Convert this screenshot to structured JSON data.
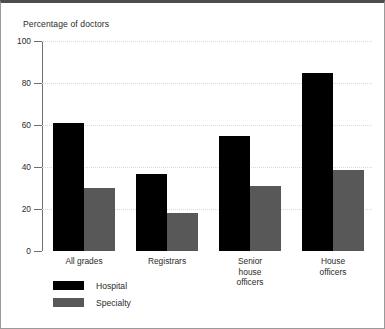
{
  "chart_data": {
    "type": "bar",
    "title": "Percentage of doctors",
    "xlabel": "",
    "ylabel": "",
    "ylim": [
      0,
      100
    ],
    "yticks": [
      0,
      20,
      40,
      60,
      80,
      100
    ],
    "ytick_labels": [
      "0",
      "20",
      "40",
      "60",
      "80",
      "100"
    ],
    "grid": true,
    "grid_style": "dotted-horizontal",
    "legend_position": "bottom-left",
    "categories": [
      "All grades",
      "Registrars",
      "Senior\nhouse\nofficers",
      "House\nofficers"
    ],
    "series": [
      {
        "name": "Hospital",
        "color": "#000000",
        "values": [
          61,
          36.5,
          55,
          85
        ]
      },
      {
        "name": "Specialty",
        "color": "#585858",
        "values": [
          30,
          18,
          31,
          38.5
        ]
      }
    ]
  },
  "figure": {
    "background": "#ffffff",
    "border_top_color": "#4d4d4d",
    "border_color": "#9a9a9a",
    "axis_color": "#6e6e6e",
    "gridline_color": "#d9d9d9",
    "text_color": "#2b2b2b"
  }
}
